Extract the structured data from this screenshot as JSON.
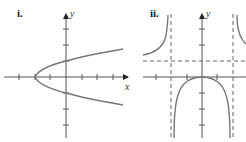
{
  "panels": [
    {
      "label": "i.",
      "x_label": "x",
      "y_label": "y",
      "description": "Sideways parabola opening right, vertex on negative x-axis, crossing y-axis at +1 and -1"
    },
    {
      "label": "ii.",
      "x_label": "x",
      "y_label": "y",
      "description": "Rational function with two vertical asymptotes, horizontal asymptote above x-axis, central branch with maximum at origin"
    }
  ],
  "colors": {
    "axis": "#555555",
    "curve": "#777777",
    "asymptote": "#666666",
    "text": "#222222"
  }
}
